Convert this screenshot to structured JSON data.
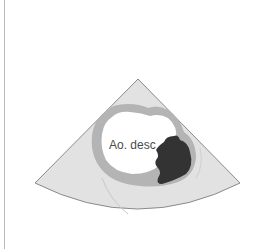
{
  "diagram": {
    "type": "echocardiography-schematic",
    "labels": {
      "vessel": "Ao. desc"
    },
    "colors": {
      "background": "#ffffff",
      "sector_fill": "#e2e2e2",
      "sector_edge": "#8a8a8a",
      "vessel_wall": "#b4b4b4",
      "lumen": "#ffffff",
      "thrombus": "#333333",
      "frame_line": "#b8b8b8"
    }
  }
}
